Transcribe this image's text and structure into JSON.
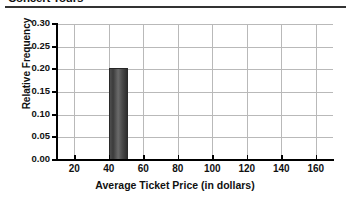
{
  "header": {
    "title": "Concert Tours",
    "rule": "horizontal-rule"
  },
  "chart_data": {
    "type": "bar",
    "title": "Concert Tours",
    "xlabel": "Average Ticket Price (in dollars)",
    "ylabel": "Relative Frequency",
    "xlim": [
      10,
      170
    ],
    "ylim": [
      0.0,
      0.3
    ],
    "grid": true,
    "legend": "none",
    "xticks": [
      20,
      40,
      60,
      80,
      100,
      120,
      140,
      160
    ],
    "xtick_labels": [
      "20",
      "40",
      "60",
      "80",
      "100",
      "120",
      "140",
      "160"
    ],
    "yticks": [
      0.0,
      0.05,
      0.1,
      0.15,
      0.2,
      0.25,
      0.3
    ],
    "ytick_labels": [
      "0.00",
      "0.05",
      "0.10",
      "0.15",
      "0.20",
      "0.25",
      "0.30"
    ],
    "bin_width": 10,
    "bars": [
      {
        "bin_start": 40,
        "bin_end": 50,
        "value": 0.2,
        "label": "40-50"
      }
    ],
    "categories": [
      "40-50"
    ],
    "values": [
      0.2
    ],
    "bar_color": "#4a4a4a",
    "grid_color": "#b9b9b9",
    "axis_color": "#000000"
  }
}
